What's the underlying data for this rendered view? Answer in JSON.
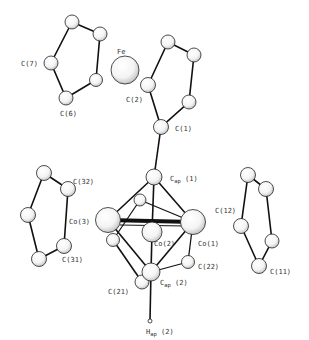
{
  "diagram": {
    "type": "molecular-structure",
    "labels": {
      "fe": "Fe",
      "c7": "C(7)",
      "c6": "C(6)",
      "c2": "C(2)",
      "c1": "C(1)",
      "cap1_main": "C",
      "cap1_sub": "ap",
      "cap1_idx": " (1)",
      "c32": "C(32)",
      "co3": "Co(3)",
      "c31": "C(31)",
      "co2": "Co(2)",
      "co1": "Co(1)",
      "c12": "C(12)",
      "c11": "C(11)",
      "c22": "C(22)",
      "c21": "C(21)",
      "cap2_main": "C",
      "cap2_sub": "ap",
      "cap2_idx": " (2)",
      "hap2_main": "H",
      "hap2_sub": "ap",
      "hap2_idx": " (2)"
    }
  }
}
